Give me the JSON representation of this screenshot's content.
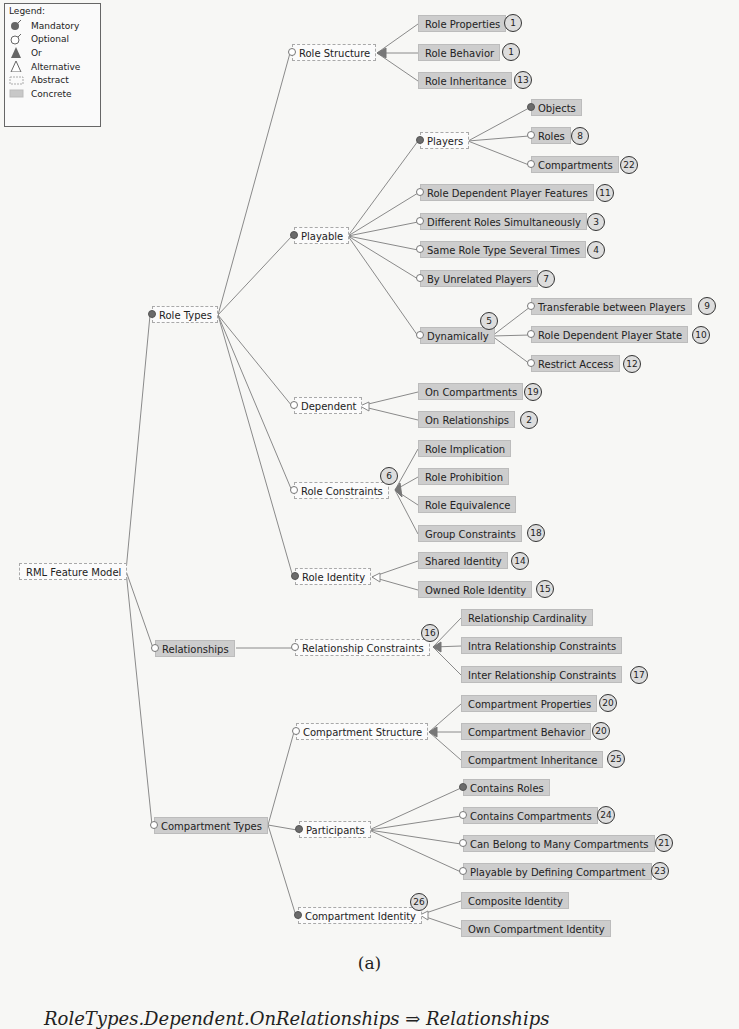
{
  "legend": {
    "title": "Legend:",
    "items": [
      {
        "icon": "mandatory-icon",
        "label": "Mandatory"
      },
      {
        "icon": "optional-icon",
        "label": "Optional"
      },
      {
        "icon": "or-group-icon",
        "label": "Or"
      },
      {
        "icon": "alternative-group-icon",
        "label": "Alternative"
      },
      {
        "icon": "abstract-box-icon",
        "label": "Abstract"
      },
      {
        "icon": "concrete-box-icon",
        "label": "Concrete"
      }
    ]
  },
  "colors": {
    "concrete": "#cdcdcd",
    "abstract": "#fbfbfb",
    "line": "#8a8a8a",
    "mandatory": "#6b6b6b"
  },
  "nodes": {
    "root": {
      "label": "RML Feature Model"
    },
    "role_types": {
      "label": "Role Types"
    },
    "relationships": {
      "label": "Relationships"
    },
    "compartment_types": {
      "label": "Compartment Types"
    },
    "role_structure": {
      "label": "Role Structure"
    },
    "role_properties": {
      "label": "Role Properties",
      "badge": "1"
    },
    "role_behavior": {
      "label": "Role Behavior",
      "badge": "1"
    },
    "role_inheritance": {
      "label": "Role Inheritance",
      "badge": "13"
    },
    "playable": {
      "label": "Playable"
    },
    "players": {
      "label": "Players"
    },
    "objects": {
      "label": "Objects"
    },
    "roles": {
      "label": "Roles",
      "badge": "8"
    },
    "compartments": {
      "label": "Compartments",
      "badge": "22"
    },
    "role_dep_player_features": {
      "label": "Role Dependent Player Features",
      "badge": "11"
    },
    "different_roles_simul": {
      "label": "Different Roles Simultaneously",
      "badge": "3"
    },
    "same_role_type_several": {
      "label": "Same Role Type Several Times",
      "badge": "4"
    },
    "by_unrelated_players": {
      "label": "By Unrelated Players",
      "badge": "7"
    },
    "dynamically": {
      "label": "Dynamically",
      "badge": "5"
    },
    "transferable": {
      "label": "Transferable between Players",
      "badge": "9"
    },
    "role_dep_player_state": {
      "label": "Role Dependent Player State",
      "badge": "10"
    },
    "restrict_access": {
      "label": "Restrict Access",
      "badge": "12"
    },
    "dependent": {
      "label": "Dependent"
    },
    "on_compartments": {
      "label": "On Compartments",
      "badge": "19"
    },
    "on_relationships": {
      "label": "On Relationships",
      "badge": "2"
    },
    "role_constraints": {
      "label": "Role Constraints",
      "badge": "6"
    },
    "role_implication": {
      "label": "Role Implication"
    },
    "role_prohibition": {
      "label": "Role Prohibition"
    },
    "role_equivalence": {
      "label": "Role Equivalence"
    },
    "group_constraints": {
      "label": "Group Constraints",
      "badge": "18"
    },
    "role_identity": {
      "label": "Role Identity"
    },
    "shared_identity": {
      "label": "Shared Identity",
      "badge": "14"
    },
    "owned_role_identity": {
      "label": "Owned Role Identity",
      "badge": "15"
    },
    "relationship_constraints": {
      "label": "Relationship Constraints",
      "badge": "16"
    },
    "relationship_cardinality": {
      "label": "Relationship Cardinality"
    },
    "intra_rel_constraints": {
      "label": "Intra Relationship Constraints"
    },
    "inter_rel_constraints": {
      "label": "Inter Relationship Constraints",
      "badge": "17"
    },
    "compartment_structure": {
      "label": "Compartment Structure"
    },
    "compartment_properties": {
      "label": "Compartment Properties",
      "badge": "20"
    },
    "compartment_behavior": {
      "label": "Compartment Behavior",
      "badge": "20"
    },
    "compartment_inheritance": {
      "label": "Compartment Inheritance",
      "badge": "25"
    },
    "participants": {
      "label": "Participants"
    },
    "contains_roles": {
      "label": "Contains Roles"
    },
    "contains_compartments": {
      "label": "Contains Compartments",
      "badge": "24"
    },
    "can_belong_many": {
      "label": "Can Belong to Many Compartments",
      "badge": "21"
    },
    "playable_by_defining": {
      "label": "Playable by Defining Compartment",
      "badge": "23"
    },
    "compartment_identity": {
      "label": "Compartment Identity",
      "badge": "26"
    },
    "composite_identity": {
      "label": "Composite Identity"
    },
    "own_compartment_identity": {
      "label": "Own Compartment Identity"
    }
  },
  "caption": {
    "subfigure": "(a)",
    "formula": "RoleTypes.Dependent.OnRelationships ⇒ Relationships"
  }
}
